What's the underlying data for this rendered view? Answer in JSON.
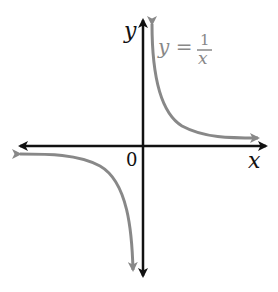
{
  "diagram": {
    "axes": {
      "x_label": "x",
      "y_label": "y",
      "origin_label": "0",
      "axis_color": "#111111"
    },
    "curve": {
      "equation_lhs": "y =",
      "numerator": "1",
      "denominator": "x",
      "color": "#888888",
      "branches": [
        "first-quadrant",
        "third-quadrant"
      ]
    }
  }
}
